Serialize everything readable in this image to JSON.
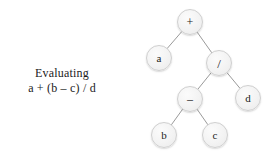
{
  "figure": {
    "background_color": "#ffffff",
    "width": 276,
    "height": 160
  },
  "caption": {
    "line1": "Evaluating",
    "line2": "a + (b – c) / d"
  },
  "tree": {
    "title": "expression-tree",
    "node_fill_color": "#f3f3f3",
    "node_border_color": "#cfcfcf",
    "edge_color": "#9a9a9a",
    "label_color": "#1c1c1c",
    "node_radius": 13,
    "nodes": [
      {
        "id": "plus",
        "label": "+",
        "kind": "operator",
        "x": 190,
        "y": 22
      },
      {
        "id": "a",
        "label": "a",
        "kind": "operand",
        "x": 159,
        "y": 58
      },
      {
        "id": "div",
        "label": "/",
        "kind": "operator",
        "x": 219,
        "y": 63
      },
      {
        "id": "minus",
        "label": "–",
        "kind": "operator",
        "x": 190,
        "y": 99
      },
      {
        "id": "d",
        "label": "d",
        "kind": "operand",
        "x": 248,
        "y": 98
      },
      {
        "id": "b",
        "label": "b",
        "kind": "operand",
        "x": 164,
        "y": 135
      },
      {
        "id": "c",
        "label": "c",
        "kind": "operand",
        "x": 215,
        "y": 135
      }
    ],
    "edges": [
      {
        "from": "plus",
        "to": "a"
      },
      {
        "from": "plus",
        "to": "div"
      },
      {
        "from": "div",
        "to": "minus"
      },
      {
        "from": "div",
        "to": "d"
      },
      {
        "from": "minus",
        "to": "b"
      },
      {
        "from": "minus",
        "to": "c"
      }
    ]
  }
}
